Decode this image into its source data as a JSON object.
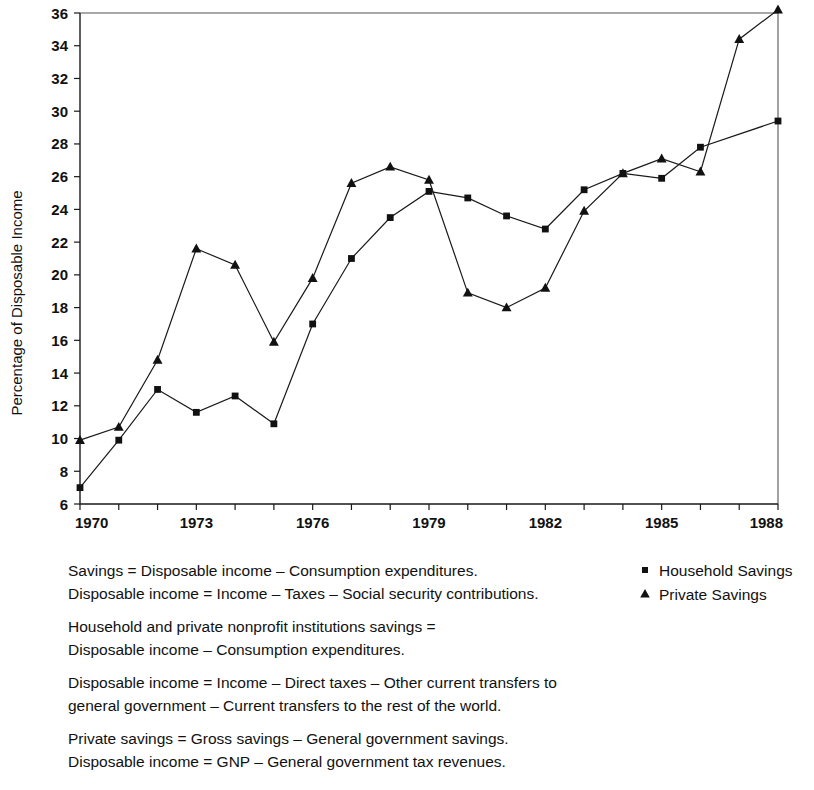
{
  "chart_data": {
    "type": "line",
    "title": "",
    "xlabel": "",
    "ylabel": "Percentage of Disposable Income",
    "x": [
      1970,
      1971,
      1972,
      1973,
      1974,
      1975,
      1976,
      1977,
      1978,
      1979,
      1980,
      1981,
      1982,
      1983,
      1984,
      1985,
      1986,
      1987,
      1988
    ],
    "xlim": [
      1970,
      1988
    ],
    "ylim": [
      6,
      36
    ],
    "xticks": [
      1970,
      1971,
      1972,
      1973,
      1974,
      1975,
      1976,
      1977,
      1978,
      1979,
      1980,
      1981,
      1982,
      1983,
      1984,
      1985,
      1986,
      1987,
      1988
    ],
    "xtick_labels": [
      "1970",
      "",
      "",
      "1973",
      "",
      "",
      "1976",
      "",
      "",
      "1979",
      "",
      "",
      "1982",
      "",
      "",
      "1985",
      "",
      "",
      "1988"
    ],
    "yticks": [
      6,
      8,
      10,
      12,
      14,
      16,
      18,
      20,
      22,
      24,
      26,
      28,
      30,
      32,
      34,
      36
    ],
    "ytick_labels": [
      "6",
      "8",
      "10",
      "12",
      "14",
      "16",
      "18",
      "20",
      "22",
      "24",
      "26",
      "28",
      "30",
      "32",
      "34",
      "36"
    ],
    "grid": false,
    "legend_position": "bottom-right",
    "series": [
      {
        "name": "Household Savings",
        "marker": "square",
        "values": [
          7.0,
          9.9,
          13.0,
          11.6,
          12.6,
          10.9,
          17.0,
          21.0,
          23.5,
          25.1,
          24.7,
          23.6,
          22.8,
          25.2,
          26.2,
          25.9,
          27.8,
          null,
          29.4
        ]
      },
      {
        "name": "Private Savings",
        "marker": "triangle",
        "values": [
          9.9,
          10.7,
          14.8,
          21.6,
          20.6,
          15.9,
          19.8,
          25.6,
          26.6,
          25.8,
          18.9,
          18.0,
          19.2,
          23.9,
          26.2,
          27.1,
          26.3,
          34.4,
          36.2
        ]
      }
    ]
  },
  "legend": {
    "items": [
      {
        "label": "Household Savings",
        "marker": "square"
      },
      {
        "label": "Private Savings",
        "marker": "triangle"
      }
    ]
  },
  "notes": {
    "paragraphs": [
      [
        "Savings = Disposable income – Consumption expenditures.",
        "Disposable income = Income – Taxes – Social security contributions."
      ],
      [
        "Household and private nonprofit institutions savings =",
        "Disposable income – Consumption expenditures."
      ],
      [
        "Disposable income = Income – Direct taxes – Other current transfers to",
        "general government – Current transfers to the rest of the world."
      ],
      [
        "Private savings = Gross savings – General government savings.",
        "Disposable income = GNP – General government tax revenues."
      ]
    ]
  },
  "colors": {
    "ink": "#111111",
    "axis": "#1a1a1a",
    "frame": "#555555",
    "background": "#ffffff"
  }
}
